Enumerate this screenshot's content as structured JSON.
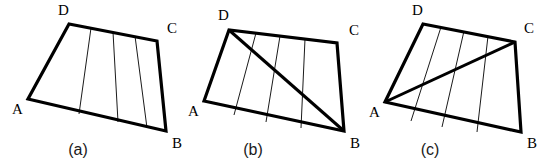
{
  "figure": {
    "background_color": "#ffffff",
    "ink_color": "#000000",
    "caption_color": "#1a1a1a",
    "width": 551,
    "height": 163
  },
  "panels": [
    {
      "id": "panel-a",
      "caption": "(a)",
      "caption_pos": {
        "x": 78,
        "y": 155
      },
      "vertices": [
        {
          "name": "A",
          "x": 28,
          "y": 99,
          "label_x": 12,
          "label_y": 114
        },
        {
          "name": "B",
          "x": 166,
          "y": 131,
          "label_x": 172,
          "label_y": 148
        },
        {
          "name": "C",
          "x": 157,
          "y": 41,
          "label_x": 167,
          "label_y": 33
        },
        {
          "name": "D",
          "x": 69,
          "y": 24,
          "label_x": 58,
          "label_y": 15
        }
      ],
      "outline": "A,B,C,D",
      "diagonal": null,
      "strip_count": 4,
      "strip_lines": [
        {
          "x1": 79,
          "y1": 114,
          "x2": 91,
          "y2": 28
        },
        {
          "x1": 118,
          "y1": 122,
          "x2": 113,
          "y2": 32
        },
        {
          "x1": 147,
          "y1": 128,
          "x2": 135,
          "y2": 36
        }
      ]
    },
    {
      "id": "panel-b",
      "caption": "(b)",
      "caption_pos": {
        "x": 253,
        "y": 155
      },
      "vertices": [
        {
          "name": "A",
          "x": 204,
          "y": 101,
          "label_x": 188,
          "label_y": 116
        },
        {
          "name": "B",
          "x": 344,
          "y": 131,
          "label_x": 350,
          "label_y": 148
        },
        {
          "name": "C",
          "x": 337,
          "y": 43,
          "label_x": 349,
          "label_y": 35
        },
        {
          "name": "D",
          "x": 229,
          "y": 30,
          "label_x": 218,
          "label_y": 20
        }
      ],
      "outline": "A,B,C,D",
      "diagonal": {
        "from": "D",
        "to": "B"
      },
      "strip_count": 4,
      "strip_lines": [
        {
          "x1": 234,
          "y1": 115,
          "x2": 256,
          "y2": 33
        },
        {
          "x1": 266,
          "y1": 122,
          "x2": 280,
          "y2": 36
        },
        {
          "x1": 301,
          "y1": 128,
          "x2": 305,
          "y2": 39
        }
      ]
    },
    {
      "id": "panel-c",
      "caption": "(c)",
      "caption_pos": {
        "x": 430,
        "y": 155
      },
      "vertices": [
        {
          "name": "A",
          "x": 385,
          "y": 102,
          "label_x": 369,
          "label_y": 117
        },
        {
          "name": "B",
          "x": 521,
          "y": 132,
          "label_x": 527,
          "label_y": 148
        },
        {
          "name": "C",
          "x": 515,
          "y": 42,
          "label_x": 524,
          "label_y": 33
        },
        {
          "name": "D",
          "x": 423,
          "y": 24,
          "label_x": 412,
          "label_y": 15
        }
      ],
      "outline": "A,B,C,D",
      "diagonal": {
        "from": "A",
        "to": "C"
      },
      "strip_count": 4,
      "strip_lines": [
        {
          "x1": 411,
          "y1": 121,
          "x2": 441,
          "y2": 27
        },
        {
          "x1": 442,
          "y1": 127,
          "x2": 464,
          "y2": 31
        },
        {
          "x1": 477,
          "y1": 132,
          "x2": 488,
          "y2": 36
        }
      ]
    }
  ]
}
